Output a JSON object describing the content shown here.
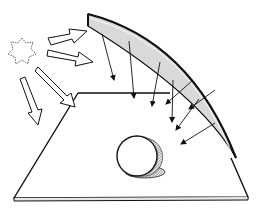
{
  "diagram": {
    "elements": {
      "sun": {
        "label": "light source",
        "icon": "sun-icon"
      },
      "incoming_rays": {
        "count": 4,
        "style": "hollow block arrows"
      },
      "reflector": {
        "label": "curved reflector",
        "fill": "#d9d9d9"
      },
      "reflected_rays": {
        "count": 8,
        "style": "thin line arrows"
      },
      "plane": {
        "label": "ground plane"
      },
      "sphere": {
        "label": "sphere",
        "shadow": "hatched ellipse"
      }
    },
    "colors": {
      "stroke": "#111111",
      "reflector_fill": "#d9d9d9",
      "background": "#ffffff",
      "shadow": "#555555"
    }
  }
}
